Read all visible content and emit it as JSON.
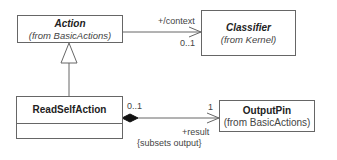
{
  "classes": {
    "action": {
      "name": "Action",
      "from": "(from BasicActions)"
    },
    "classifier": {
      "name": "Classifier",
      "from": "(from Kernel)"
    },
    "read_self_action": {
      "name": "ReadSelfAction"
    },
    "output_pin": {
      "name": "OutputPin",
      "from": "(from BasicActions)"
    }
  },
  "associations": {
    "context": {
      "role": "+/context",
      "multiplicity": "0..1"
    },
    "result": {
      "source_multiplicity": "0..1",
      "target_multiplicity": "1",
      "role": "+result",
      "constraint": "{subsets output}"
    }
  }
}
